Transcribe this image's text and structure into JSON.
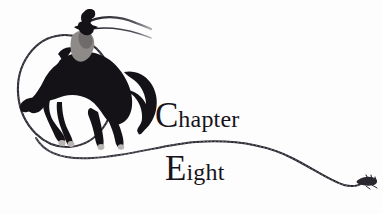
{
  "page": {
    "width": 383,
    "height": 214,
    "background_color": "#fdfdfd",
    "ink_color": "#16141a"
  },
  "heading": {
    "line1": {
      "dropcap": "C",
      "rest": "hapter",
      "full_text": "Chapter"
    },
    "line2": {
      "dropcap": "E",
      "rest": "ight",
      "full_text": "Eight"
    }
  },
  "illustration": {
    "name": "bucking-bronco-lasso-illustration",
    "elements": [
      "lasso-loop",
      "bucking-horse-silhouette",
      "cowboy-rider-silhouette",
      "raised-arm-whip",
      "trailing-rope",
      "rope-frayed-tip"
    ],
    "colors": {
      "silhouette": "#141217",
      "rider_shirt": "#8d8a88",
      "rope": "#2a2730",
      "hooves": "#b9b5b2"
    }
  }
}
